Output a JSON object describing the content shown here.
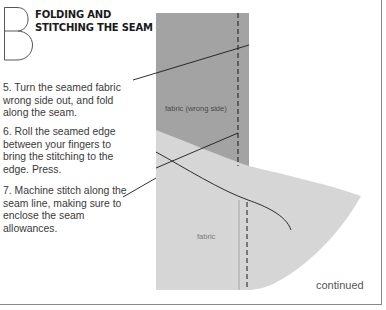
{
  "section": {
    "letter": "B",
    "title_lines": [
      "FOLDING AND",
      "STITCHING THE SEAM"
    ]
  },
  "steps": [
    {
      "number": 5,
      "lines": [
        "5. Turn the seamed fabric",
        "wrong side out, and fold",
        "along the seam."
      ]
    },
    {
      "number": 6,
      "lines": [
        "6. Roll the seamed edge",
        "between your fingers to",
        "bring the stitching to the",
        "edge. Press."
      ]
    },
    {
      "number": 7,
      "lines": [
        "7. Machine stitch along the",
        "seam line, making sure to",
        "enclose the seam",
        "allowances."
      ]
    }
  ],
  "illustration": {
    "labels": {
      "wrong_side": "fabric (wrong side)",
      "right_side": "fabric"
    },
    "colors": {
      "fabric_wrong_side": "#a3a3a3",
      "fabric_right_side": "#d6d6d6",
      "stitch_line": "#1a1a1a",
      "pointer_line": "#1a1a1a"
    }
  },
  "footer": {
    "continued": "continued"
  }
}
